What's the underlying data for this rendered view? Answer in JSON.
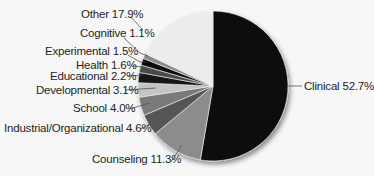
{
  "chart_data": {
    "type": "pie",
    "title": "",
    "start_angle_deg": 0,
    "direction": "clockwise",
    "center": [
      213,
      86
    ],
    "radius": 75,
    "slices": [
      {
        "label": "Clinical",
        "value": 52.7,
        "display": "Clinical 52.7%",
        "color": "#0a0a0a"
      },
      {
        "label": "Counseling",
        "value": 11.3,
        "display": "Counseling 11.3%",
        "color": "#8c8c8c"
      },
      {
        "label": "Industrial/Organizational",
        "value": 4.6,
        "display": "Industrial/Organizational 4.6%",
        "color": "#555555"
      },
      {
        "label": "School",
        "value": 4.0,
        "display": "School 4.0%",
        "color": "#7a7a7a"
      },
      {
        "label": "Developmental",
        "value": 3.1,
        "display": "Developmental 3.1%",
        "color": "#c4c4c4"
      },
      {
        "label": "Educational",
        "value": 2.2,
        "display": "Educational 2.2%",
        "color": "#141414"
      },
      {
        "label": "Health",
        "value": 1.6,
        "display": "Health 1.6%",
        "color": "#4a4a4a"
      },
      {
        "label": "Experimental",
        "value": 1.5,
        "display": "Experimental 1.5%",
        "color": "#111111"
      },
      {
        "label": "Cognitive",
        "value": 1.1,
        "display": "Cognitive 1.1%",
        "color": "#8a8a8a"
      },
      {
        "label": "Other",
        "value": 17.9,
        "display": "Other 17.9%",
        "color": "#ececec"
      }
    ],
    "legend": "none (direct labels with leader lines)"
  },
  "labels": {
    "clinical": "Clinical 52.7%",
    "counseling": "Counseling 11.3%",
    "industrial": "Industrial/Organizational 4.6%",
    "school": "School 4.0%",
    "developmental": "Developmental 3.1%",
    "educational": "Educational 2.2%",
    "health": "Health 1.6%",
    "experimental": "Experimental 1.5%",
    "cognitive": "Cognitive 1.1%",
    "other": "Other 17.9%"
  }
}
